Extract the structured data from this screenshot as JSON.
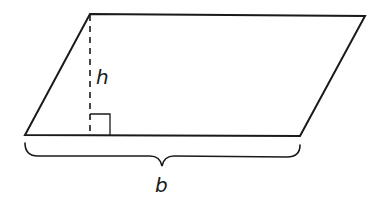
{
  "figure": {
    "shape": "parallelogram",
    "stroke_color": "#1a1a1a",
    "vertices": {
      "top_left": [
        90,
        14
      ],
      "top_right": [
        365,
        16
      ],
      "bottom_right": [
        300,
        136
      ],
      "bottom_left": [
        25,
        135
      ]
    }
  },
  "height_line": {
    "style": "dashed",
    "x": 90,
    "y_top": 14,
    "y_bottom": 135
  },
  "right_angle_marker": {
    "x": 90,
    "y": 114,
    "size": 20
  },
  "labels": {
    "height": "h",
    "base": "b"
  },
  "base_brace": {
    "x_start": 25,
    "x_end": 300,
    "y_top": 143,
    "tip": [
      162,
      166
    ]
  }
}
